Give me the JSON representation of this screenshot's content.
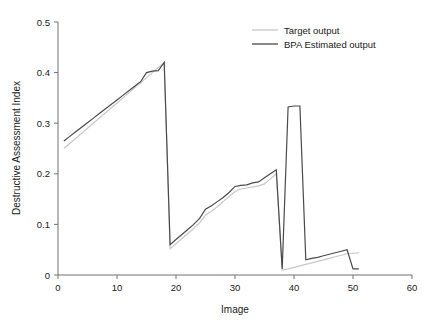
{
  "chart_data": {
    "type": "line",
    "title": "",
    "xlabel": "Image",
    "ylabel": "Destructive Assessment Index",
    "xlim": [
      0,
      60
    ],
    "ylim": [
      0,
      0.5
    ],
    "xticks": [
      0,
      10,
      20,
      30,
      40,
      50,
      60
    ],
    "xtick_labels": [
      "0",
      "10",
      "20",
      "30",
      "40",
      "50",
      "60"
    ],
    "yticks": [
      0,
      0.1,
      0.2,
      0.3,
      0.4,
      0.5
    ],
    "ytick_labels": [
      "0",
      "0.1",
      "0.2",
      "0.3",
      "0.4",
      "0.5"
    ],
    "grid": false,
    "legend_position": "top-right",
    "series": [
      {
        "name": "Target output",
        "color": "#c8c8c8",
        "x": [
          1,
          2,
          3,
          4,
          5,
          6,
          7,
          8,
          9,
          10,
          11,
          12,
          13,
          14,
          15,
          16,
          17,
          18,
          19,
          20,
          21,
          22,
          23,
          24,
          25,
          26,
          27,
          28,
          29,
          30,
          31,
          32,
          33,
          34,
          35,
          36,
          37,
          38,
          39,
          40,
          41,
          42,
          43,
          44,
          45,
          46,
          47,
          48,
          49,
          50,
          51
        ],
        "values": [
          0.25,
          0.26,
          0.27,
          0.28,
          0.29,
          0.3,
          0.31,
          0.32,
          0.33,
          0.34,
          0.35,
          0.36,
          0.37,
          0.38,
          0.39,
          0.4,
          0.41,
          0.42,
          0.052,
          0.062,
          0.072,
          0.082,
          0.092,
          0.103,
          0.118,
          0.126,
          0.135,
          0.145,
          0.155,
          0.165,
          0.17,
          0.172,
          0.174,
          0.176,
          0.18,
          0.19,
          0.2,
          0.01,
          0.012,
          0.015,
          0.018,
          0.021,
          0.024,
          0.027,
          0.03,
          0.033,
          0.036,
          0.039,
          0.042,
          0.043,
          0.044
        ]
      },
      {
        "name": "BPA Estimated output",
        "color": "#4a4a4a",
        "x": [
          1,
          2,
          3,
          4,
          5,
          6,
          7,
          8,
          9,
          10,
          11,
          12,
          13,
          14,
          15,
          16,
          17,
          18,
          19,
          20,
          21,
          22,
          23,
          24,
          25,
          26,
          27,
          28,
          29,
          30,
          31,
          32,
          33,
          34,
          35,
          36,
          37,
          38,
          39,
          40,
          41,
          42,
          43,
          44,
          45,
          46,
          47,
          48,
          49,
          50,
          51
        ],
        "values": [
          0.265,
          0.274,
          0.283,
          0.292,
          0.301,
          0.31,
          0.319,
          0.328,
          0.337,
          0.346,
          0.355,
          0.364,
          0.373,
          0.382,
          0.4,
          0.403,
          0.404,
          0.42,
          0.06,
          0.07,
          0.08,
          0.09,
          0.1,
          0.112,
          0.13,
          0.137,
          0.145,
          0.153,
          0.163,
          0.175,
          0.177,
          0.178,
          0.182,
          0.184,
          0.192,
          0.2,
          0.208,
          0.012,
          0.332,
          0.334,
          0.334,
          0.03,
          0.033,
          0.035,
          0.038,
          0.041,
          0.044,
          0.047,
          0.05,
          0.012,
          0.012
        ]
      }
    ],
    "annotations": []
  },
  "legend": {
    "items": [
      {
        "label": "Target output",
        "color": "#c8c8c8"
      },
      {
        "label": "BPA Estimated output",
        "color": "#4a4a4a"
      }
    ]
  }
}
